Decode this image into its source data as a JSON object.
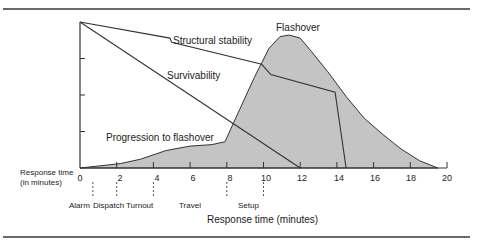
{
  "chart_data": {
    "type": "line",
    "title": "",
    "xlabel": "Response time (minutes)",
    "ylabel": "",
    "side_axis_label": [
      "Response time",
      "(in minutes)"
    ],
    "xlim": [
      0,
      20
    ],
    "ylim": [
      0,
      100
    ],
    "x_ticks": [
      0,
      2,
      4,
      6,
      8,
      10,
      12,
      14,
      16,
      18,
      20
    ],
    "y_ticks": [
      25,
      50,
      75
    ],
    "grid": false,
    "legend": "inline annotations",
    "series": [
      {
        "name": "Progression to flashover / Flashover (fire growth, shaded area)",
        "style": "filled-area",
        "points": [
          [
            0,
            0
          ],
          [
            2.2,
            3
          ],
          [
            3.3,
            6
          ],
          [
            4.7,
            12
          ],
          [
            6.0,
            15
          ],
          [
            7.2,
            16
          ],
          [
            7.9,
            18
          ],
          [
            8.7,
            40
          ],
          [
            9.5,
            62
          ],
          [
            10.3,
            82
          ],
          [
            10.9,
            90
          ],
          [
            11.4,
            91
          ],
          [
            12.0,
            89
          ],
          [
            12.6,
            80
          ],
          [
            13.5,
            66
          ],
          [
            14.5,
            49
          ],
          [
            15.5,
            34
          ],
          [
            16.5,
            23
          ],
          [
            17.5,
            13
          ],
          [
            18.5,
            5
          ],
          [
            19.5,
            0
          ]
        ]
      },
      {
        "name": "Structural stability",
        "style": "line",
        "points": [
          [
            0,
            100
          ],
          [
            4.9,
            89
          ],
          [
            5.0,
            86
          ],
          [
            9.9,
            71
          ],
          [
            10.4,
            64
          ],
          [
            13.9,
            52
          ],
          [
            14.5,
            0
          ]
        ]
      },
      {
        "name": "Survivability",
        "style": "line",
        "points": [
          [
            0,
            100
          ],
          [
            12,
            0
          ]
        ]
      }
    ],
    "annotations": [
      {
        "text": "Structural stability",
        "x": 5.2,
        "y": 90
      },
      {
        "text": "Flashover",
        "x": 10.5,
        "y": 97
      },
      {
        "text": "Survivability",
        "x": 6.5,
        "y": 68
      },
      {
        "text": "Progression to flashover",
        "x": 1.4,
        "y": 21
      }
    ],
    "response_phases": [
      {
        "label": "Alarm",
        "marker_at": 0.7
      },
      {
        "label": "Dispatch",
        "marker_at": 2
      },
      {
        "label": "Turnout",
        "marker_at": 4
      },
      {
        "label": "Travel",
        "marker_at": 8
      },
      {
        "label": "Setup",
        "marker_at": 10
      }
    ],
    "colors": {
      "fill": "#c4c4c4",
      "line": "#333333"
    }
  },
  "labels": {
    "side_line1": "Response time",
    "side_line2": "(in minutes)",
    "xlabel": "Response time (minutes)",
    "structural": "Structural stability",
    "flashover": "Flashover",
    "survivability": "Survivability",
    "progression": "Progression to flashover",
    "ticks": [
      "0",
      "2",
      "4",
      "6",
      "8",
      "10",
      "12",
      "14",
      "16",
      "18",
      "20"
    ],
    "phases": [
      "Alarm",
      "Dispatch",
      "Turnout",
      "Travel",
      "Setup"
    ]
  }
}
